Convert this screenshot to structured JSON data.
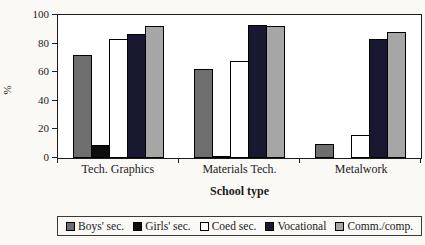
{
  "chart_data": {
    "type": "bar",
    "title": "",
    "categories": [
      "Tech. Graphics",
      "Materials Tech.",
      "Metalwork"
    ],
    "series": [
      {
        "name": "Boys' sec.",
        "color": "#6e6e6e",
        "values": [
          72,
          62,
          10
        ]
      },
      {
        "name": "Girls' sec.",
        "color": "#0d0d0d",
        "values": [
          9,
          1,
          0
        ]
      },
      {
        "name": "Coed sec.",
        "color": "#ffffff",
        "values": [
          83,
          68,
          16
        ]
      },
      {
        "name": "Vocational",
        "color": "#181830",
        "values": [
          87,
          93,
          83
        ]
      },
      {
        "name": "Comm./comp.",
        "color": "#a6a6a6",
        "values": [
          92,
          92,
          88
        ]
      }
    ],
    "xlabel": "School type",
    "ylabel": "%",
    "ylim": [
      0,
      100
    ],
    "yticks": [
      0,
      20,
      40,
      60,
      80,
      100
    ],
    "grid": false,
    "legend_position": "bottom",
    "bar_border_color": "#000000"
  }
}
